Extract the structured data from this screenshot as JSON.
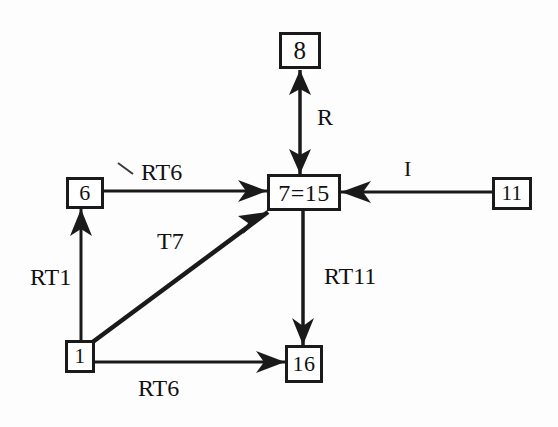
{
  "diagram": {
    "background_color": "#fdfdfd",
    "stroke_color": "#1a1a1a",
    "nodes": [
      {
        "id": "n8",
        "label": "8",
        "name": "node-8"
      },
      {
        "id": "n6",
        "label": "6",
        "name": "node-6"
      },
      {
        "id": "n7_15",
        "label": "7=15",
        "name": "node-7-15"
      },
      {
        "id": "n11",
        "label": "11",
        "name": "node-11"
      },
      {
        "id": "n1",
        "label": "1",
        "name": "node-1"
      },
      {
        "id": "n16",
        "label": "16",
        "name": "node-16"
      }
    ],
    "edges": [
      {
        "id": "e_r",
        "label": "R",
        "from": "n7_15",
        "to": "n8",
        "direction": "bidirectional",
        "orientation": "vertical"
      },
      {
        "id": "e_rt6_top",
        "label": "RT6",
        "from": "n6",
        "to": "n7_15",
        "direction": "forward",
        "orientation": "horizontal"
      },
      {
        "id": "e_i",
        "label": "I",
        "from": "n11",
        "to": "n7_15",
        "direction": "forward",
        "orientation": "horizontal"
      },
      {
        "id": "e_t7",
        "label": "T7",
        "from": "n1",
        "to": "n7_15",
        "direction": "forward",
        "orientation": "diagonal"
      },
      {
        "id": "e_rt1",
        "label": "RT1",
        "from": "n1",
        "to": "n6",
        "direction": "forward",
        "orientation": "vertical"
      },
      {
        "id": "e_rt11",
        "label": "RT11",
        "from": "n7_15",
        "to": "n16",
        "direction": "forward",
        "orientation": "vertical"
      },
      {
        "id": "e_rt6_bot",
        "label": "RT6",
        "from": "n1",
        "to": "n16",
        "direction": "forward",
        "orientation": "horizontal"
      }
    ]
  }
}
